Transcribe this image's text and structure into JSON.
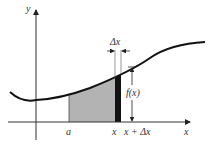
{
  "diagram": {
    "axes": {
      "y_label": "y",
      "x_label": "x"
    },
    "curve_label": "f(x)",
    "strip_width_label": "Δx",
    "x_ticks": {
      "a": "a",
      "x": "x",
      "x_plus_dx": "x + Δx"
    },
    "colors": {
      "curve": "#111111",
      "shaded_region": "#b3b3b3",
      "strip": "#111111",
      "axis": "#333333"
    }
  }
}
